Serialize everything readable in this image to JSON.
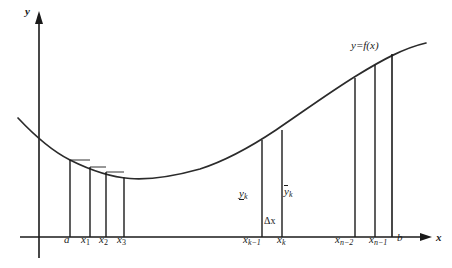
{
  "figure": {
    "ink_color": "#1a1a1a",
    "background": "#ffffff"
  },
  "axes": {
    "y_axis_label": "y",
    "x_axis_label": "x",
    "y_axis_x_px": 39,
    "x_axis_y_px": 237
  },
  "curve": {
    "label": "y=f(x)",
    "shape": "upward-opening parabola-like convex curve",
    "points": [
      {
        "x": 18,
        "y": 118
      },
      {
        "x": 40,
        "y": 140
      },
      {
        "x": 70,
        "y": 160
      },
      {
        "x": 100,
        "y": 172
      },
      {
        "x": 125,
        "y": 177
      },
      {
        "x": 148,
        "y": 179
      },
      {
        "x": 175,
        "y": 176
      },
      {
        "x": 205,
        "y": 168
      },
      {
        "x": 235,
        "y": 155
      },
      {
        "x": 262,
        "y": 140
      },
      {
        "x": 290,
        "y": 122
      },
      {
        "x": 320,
        "y": 102
      },
      {
        "x": 350,
        "y": 82
      },
      {
        "x": 375,
        "y": 66
      },
      {
        "x": 395,
        "y": 53
      },
      {
        "x": 425,
        "y": 44
      }
    ]
  },
  "partition_lines": [
    {
      "name": "a",
      "x_px": 70,
      "top_y_px": 160
    },
    {
      "name": "x1",
      "x_px": 90,
      "top_y_px": 167
    },
    {
      "name": "x2",
      "x_px": 106,
      "top_y_px": 172
    },
    {
      "name": "x3",
      "x_px": 124,
      "top_y_px": 177
    },
    {
      "name": "xk-1",
      "x_px": 262,
      "top_y_px": 140
    },
    {
      "name": "xk",
      "x_px": 282,
      "top_y_px": 131
    },
    {
      "name": "xn-2",
      "x_px": 355,
      "top_y_px": 79
    },
    {
      "name": "xn-1",
      "x_px": 375,
      "top_y_px": 66
    },
    {
      "name": "b",
      "x_px": 392,
      "top_y_px": 55
    }
  ],
  "tick_labels": [
    {
      "id": "a",
      "base": "a",
      "sub": "",
      "x_px": 65,
      "y_px": 241
    },
    {
      "id": "x1",
      "base": "x",
      "sub": "1",
      "x_px": 84,
      "y_px": 241
    },
    {
      "id": "x2",
      "base": "x",
      "sub": "2",
      "x_px": 102,
      "y_px": 241
    },
    {
      "id": "x3",
      "base": "x",
      "sub": "3",
      "x_px": 120,
      "y_px": 241
    },
    {
      "id": "xk-1",
      "base": "x",
      "sub": "k−1",
      "x_px": 244,
      "y_px": 241
    },
    {
      "id": "xk",
      "base": "x",
      "sub": "k",
      "x_px": 279,
      "y_px": 241
    },
    {
      "id": "xn-2",
      "base": "x",
      "sub": "n−2",
      "x_px": 337,
      "y_px": 241
    },
    {
      "id": "xn-1",
      "base": "x",
      "sub": "n−1",
      "x_px": 371,
      "y_px": 241
    },
    {
      "id": "b",
      "base": "b",
      "sub": "",
      "x_px": 396,
      "y_px": 239
    }
  ],
  "annotations": {
    "lower_value": {
      "base": "y",
      "sub": "k",
      "style": "underlined",
      "x_px": 240,
      "y_px": 195
    },
    "upper_value": {
      "base": "y",
      "sub": "k",
      "style": "overbar",
      "x_px": 285,
      "y_px": 193
    },
    "delta_x": {
      "text": "Δx",
      "x_px": 263,
      "y_px": 222
    },
    "function_label": {
      "text": "y=f(x)",
      "x_px": 352,
      "y_px": 47
    },
    "y_axis_name": {
      "text": "y",
      "x_px": 26,
      "y_px": 13
    },
    "x_axis_name": {
      "text": "x",
      "x_px": 437,
      "y_px": 240
    }
  }
}
